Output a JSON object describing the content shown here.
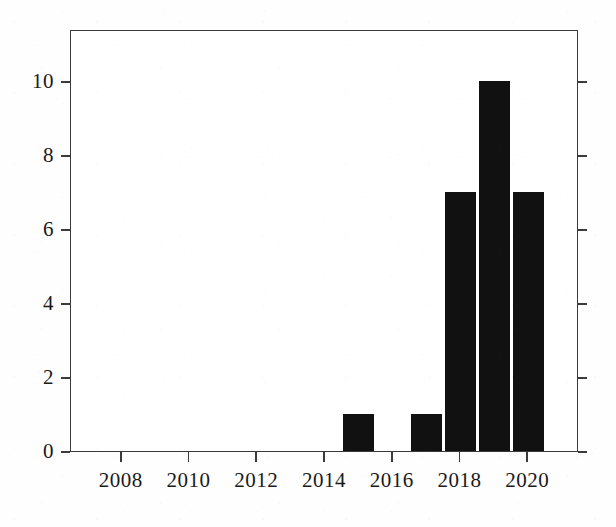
{
  "chart_data": {
    "type": "bar",
    "title": "",
    "subtitle": "",
    "xlabel": "",
    "ylabel": "",
    "categories": [
      "2015",
      "2017",
      "2018",
      "2019",
      "2020"
    ],
    "values": [
      1,
      1,
      7,
      10,
      7
    ],
    "x": [
      2015,
      2017,
      2018,
      2019,
      2020
    ],
    "xlim": [
      2006.5,
      2021.5
    ],
    "ylim": [
      0,
      11.4
    ],
    "xticks": [
      2008,
      2010,
      2012,
      2014,
      2016,
      2018,
      2020
    ],
    "xtick_labels": [
      "2008",
      "2010",
      "2012",
      "2014",
      "2016",
      "2018",
      "2020"
    ],
    "yticks": [
      0,
      2,
      4,
      6,
      8,
      10
    ],
    "ytick_labels": [
      "0",
      "2",
      "4",
      "6",
      "8",
      "10"
    ],
    "grid": false,
    "legend": null,
    "legend_position": "none",
    "bar_color": "#111111",
    "axis_color": "#3b3b3b",
    "background_color": "#ffffff",
    "bar_width_years": 0.92,
    "annotations": []
  },
  "axes": {
    "y_ticks": [
      {
        "label": "10",
        "value": 10
      },
      {
        "label": "8",
        "value": 8
      },
      {
        "label": "6",
        "value": 6
      },
      {
        "label": "4",
        "value": 4
      },
      {
        "label": "2",
        "value": 2
      },
      {
        "label": "0",
        "value": 0
      }
    ],
    "x_ticks": [
      {
        "label": "2008",
        "value": 2008
      },
      {
        "label": "2010",
        "value": 2010
      },
      {
        "label": "2012",
        "value": 2012
      },
      {
        "label": "2014",
        "value": 2014
      },
      {
        "label": "2016",
        "value": 2016
      },
      {
        "label": "2018",
        "value": 2018
      },
      {
        "label": "2020",
        "value": 2020
      }
    ]
  },
  "bars": [
    {
      "label": "2015",
      "value": 1
    },
    {
      "label": "2017",
      "value": 1
    },
    {
      "label": "2018",
      "value": 7
    },
    {
      "label": "2019",
      "value": 10
    },
    {
      "label": "2020",
      "value": 7
    }
  ]
}
